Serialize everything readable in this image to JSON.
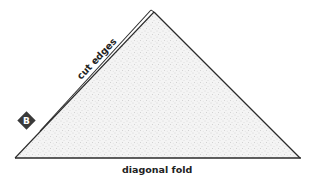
{
  "diagram": {
    "shape": "folded-triangle",
    "labels": {
      "cut_edges": "cut edges",
      "diagonal_fold": "diagonal fold"
    },
    "badge": {
      "letter": "B",
      "color": "#3a3a3a"
    },
    "colors": {
      "fill": "#f2f2f2",
      "stroke": "#2a2a2a",
      "stipple": "#bdbdbd"
    }
  }
}
